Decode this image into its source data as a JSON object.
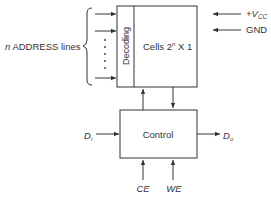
{
  "diagram": {
    "address_label": "n ADDRESS lines",
    "address_n": "n",
    "address_rest": " ADDRESS lines",
    "decoding_label": "Decoding",
    "cells_label_prefix": "Cells 2",
    "cells_label_sup": "n",
    "cells_label_suffix": " X 1",
    "vcc_label": "+V",
    "vcc_sub": "CC",
    "gnd_label": "GND",
    "control_label": "Control",
    "di_label": "D",
    "di_sub": "i",
    "do_label": "D",
    "do_sub": "o",
    "ce_label": "CE",
    "we_label": "WE",
    "colors": {
      "line": "#333333",
      "background": "#ffffff"
    }
  }
}
